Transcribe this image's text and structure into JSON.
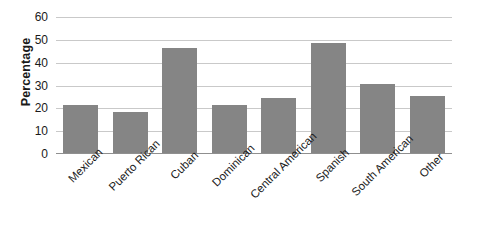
{
  "chart_data": {
    "type": "bar",
    "title": "",
    "xlabel": "",
    "ylabel": "Percentage",
    "ylim": [
      0,
      60
    ],
    "ytick_step": 10,
    "yticks": [
      60,
      50,
      40,
      30,
      20,
      10,
      0
    ],
    "grid": true,
    "legend": "none",
    "bar_color": "#858585",
    "gridline_color": "#c9c9c9",
    "axis_color": "#8f8f8f",
    "categories": [
      "Mexican",
      "Puerto Rican",
      "Cuban",
      "Dominican",
      "Central American",
      "Spanish",
      "South American",
      "Other"
    ],
    "values": [
      21.5,
      18.4,
      46.3,
      21.5,
      24.5,
      48.7,
      30.7,
      25.5
    ]
  }
}
